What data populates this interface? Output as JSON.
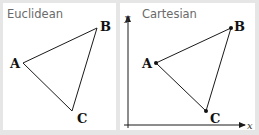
{
  "panels": [
    {
      "title": "Euclidean",
      "vertices": [
        {
          "label": "A",
          "x": 23,
          "y": 63
        },
        {
          "label": "B",
          "x": 97,
          "y": 28
        },
        {
          "label": "C",
          "x": 72,
          "y": 111
        }
      ],
      "show_points": false,
      "show_axes": false
    },
    {
      "title": "Cartesian",
      "vertices": [
        {
          "label": "A",
          "x": 156,
          "y": 63
        },
        {
          "label": "B",
          "x": 231,
          "y": 28
        },
        {
          "label": "C",
          "x": 206,
          "y": 111
        }
      ],
      "show_points": true,
      "show_axes": true,
      "axes": {
        "x_label": "x",
        "y_label": "y"
      }
    }
  ],
  "colors": {
    "background": "#e6e6e6",
    "panel": "#ffffff",
    "line": "#1a1a1a",
    "title": "#6a6a6a"
  }
}
